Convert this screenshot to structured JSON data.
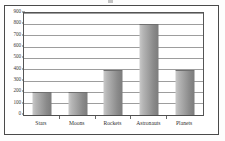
{
  "chart_data": {
    "type": "bar",
    "title": "",
    "subtitle": "",
    "xlabel": "",
    "ylabel": "",
    "categories": [
      "Stars",
      "Moons",
      "Rockets",
      "Astronauts",
      "Planets"
    ],
    "values": [
      200,
      200,
      400,
      800,
      400
    ],
    "series": [
      {
        "name": "",
        "values": [
          200,
          200,
          400,
          800,
          400
        ]
      }
    ],
    "ylim": [
      0,
      900
    ],
    "ytick_step": 100,
    "yticks": [
      0,
      100,
      200,
      300,
      400,
      500,
      600,
      700,
      800,
      900
    ],
    "ytick_labels": [
      "0",
      "100",
      "200",
      "300",
      "400",
      "500",
      "600",
      "700",
      "800",
      "900"
    ],
    "grid": true,
    "grid_axis": "y",
    "legend": false,
    "legend_position": "none",
    "annotations": [],
    "data_labels": false
  },
  "style": {
    "bar_fill_light": "#c9c9c9",
    "bar_fill_dark": "#7c7c7c",
    "gridline_color": "#9d9d9d",
    "axis_color": "#555555",
    "frame_color": "#4a4a4a",
    "text_color": "#2f2f2f",
    "background": "#ffffff"
  }
}
